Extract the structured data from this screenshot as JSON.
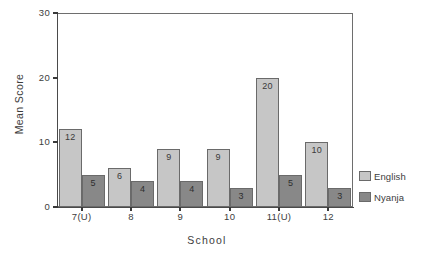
{
  "chart_data": {
    "type": "bar",
    "title": "",
    "xlabel": "School",
    "ylabel": "Mean Score",
    "categories": [
      "7(U)",
      "8",
      "9",
      "10",
      "11(U)",
      "12"
    ],
    "series": [
      {
        "name": "English",
        "color": "#c6c6c6",
        "values": [
          12,
          6,
          9,
          9,
          20,
          10
        ]
      },
      {
        "name": "Nyanja",
        "color": "#888888",
        "values": [
          5,
          4,
          4,
          3,
          5,
          3
        ]
      }
    ],
    "ylim": [
      0,
      30
    ],
    "yticks": [
      0,
      10,
      20,
      30
    ],
    "ytick_labels": [
      "0",
      "10",
      "20",
      "30"
    ],
    "grid": false,
    "legend_position": "right",
    "show_value_labels": true
  },
  "axes": {
    "y_title": "Mean Score",
    "x_title": "School"
  },
  "legend": {
    "entries": [
      {
        "label": "English",
        "color": "#c6c6c6"
      },
      {
        "label": "Nyanja",
        "color": "#888888"
      }
    ]
  }
}
